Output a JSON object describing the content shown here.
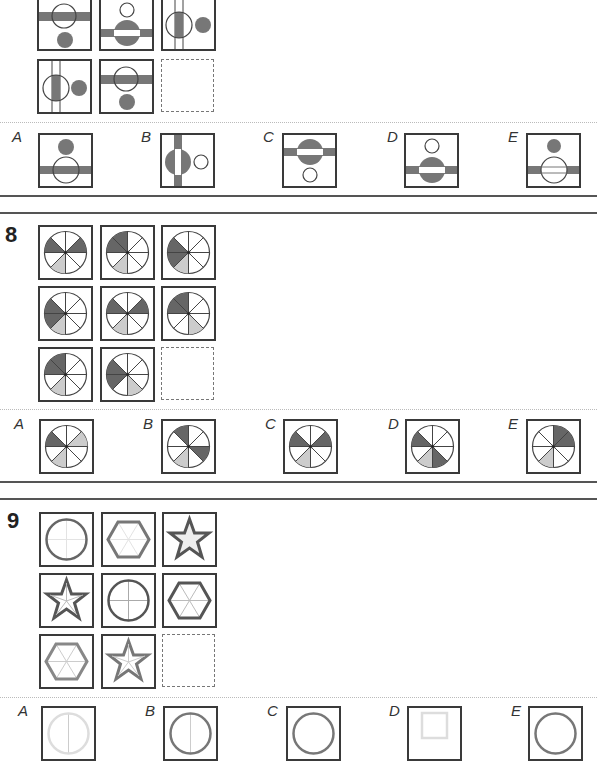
{
  "colors": {
    "dark": "#666666",
    "light": "#cccccc",
    "border": "#3a3a3a",
    "stroke": "#555555"
  },
  "section7": {
    "grid_labels": [
      "r1c1",
      "r1c2",
      "r1c3",
      "r2c1",
      "r2c2",
      "r2c3-missing"
    ],
    "answers": [
      {
        "label": "A"
      },
      {
        "label": "B"
      },
      {
        "label": "C"
      },
      {
        "label": "D"
      },
      {
        "label": "E"
      }
    ]
  },
  "section8": {
    "number": "8",
    "answers": [
      {
        "label": "A"
      },
      {
        "label": "B"
      },
      {
        "label": "C"
      },
      {
        "label": "D"
      },
      {
        "label": "E"
      }
    ]
  },
  "section9": {
    "number": "9",
    "answers": [
      {
        "label": "A"
      },
      {
        "label": "B"
      },
      {
        "label": "C"
      },
      {
        "label": "D"
      },
      {
        "label": "E"
      }
    ]
  }
}
